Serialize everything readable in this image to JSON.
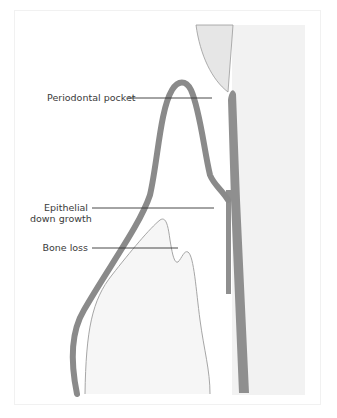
{
  "figure": {
    "labels": {
      "periodontal_pocket": "Periodontal pocket",
      "epithelial_line1": "Epithelial",
      "epithelial_line2": "down growth",
      "bone_loss": "Bone loss"
    },
    "colors": {
      "tooth_fill": "#f2f2f2",
      "crown_fill": "#e6e6e6",
      "gingiva_stroke": "#8a8a8a",
      "root_band": "#8f8f8f",
      "bone_stroke": "#a6a6a6",
      "leader_line": "#333333",
      "frame": "#f1f1f1"
    }
  }
}
